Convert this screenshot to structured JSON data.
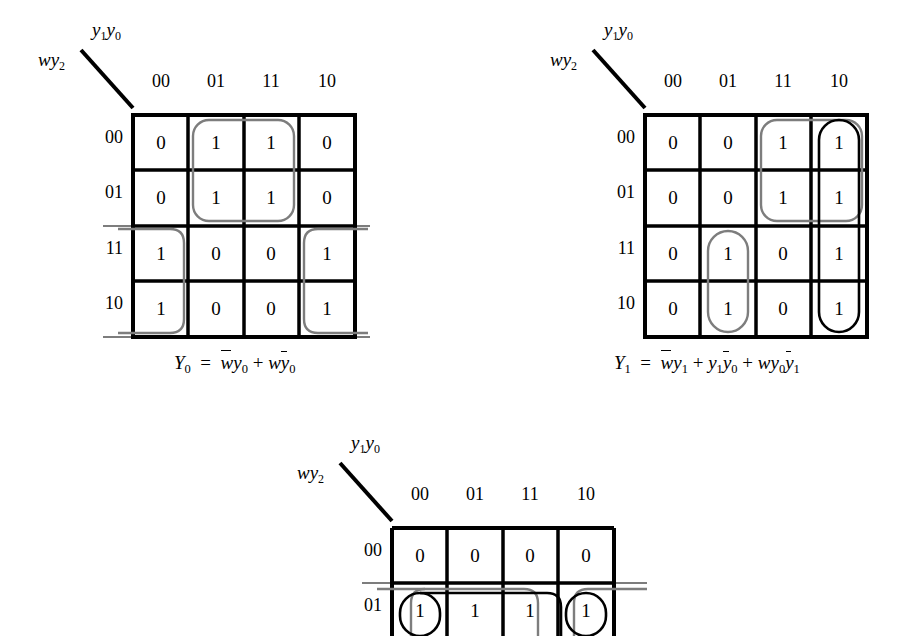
{
  "page": {
    "background": "#ffffff",
    "grid_color": "#000000",
    "group_black": "#000000",
    "group_gray": "#7d7d7d"
  },
  "maps": [
    {
      "id": "kmap-y0",
      "row_var_label": "wy2",
      "col_var_label": "y1y0",
      "col_headers": [
        "00",
        "01",
        "11",
        "10"
      ],
      "row_headers": [
        "00",
        "01",
        "11",
        "10"
      ],
      "cells": [
        [
          "0",
          "1",
          "1",
          "0"
        ],
        [
          "0",
          "1",
          "1",
          "0"
        ],
        [
          "1",
          "0",
          "0",
          "1"
        ],
        [
          "1",
          "0",
          "0",
          "1"
        ]
      ],
      "groups": [
        {
          "name": "group-w-bar-y0",
          "color": "gray",
          "cols": [
            1,
            2
          ],
          "rows": [
            0,
            1
          ],
          "wrap": "none"
        },
        {
          "name": "group-w-y0-bar",
          "color": "gray",
          "cols": [
            0,
            3
          ],
          "rows": [
            2,
            3
          ],
          "wrap": "horizontal"
        }
      ],
      "formula": {
        "lhs": "Y",
        "lhs_sub": "0",
        "eq": "=",
        "terms": [
          {
            "vars": [
              {
                "sym": "w",
                "bar": true,
                "sub": ""
              },
              {
                "sym": "y",
                "bar": false,
                "sub": "0"
              }
            ]
          },
          {
            "vars": [
              {
                "sym": "w",
                "bar": false,
                "sub": ""
              },
              {
                "sym": "y",
                "bar": true,
                "sub": "0"
              }
            ]
          }
        ],
        "plain": "Y0 = w̄y0 + wȳ0"
      }
    },
    {
      "id": "kmap-y1",
      "row_var_label": "wy2",
      "col_var_label": "y1y0",
      "col_headers": [
        "00",
        "01",
        "11",
        "10"
      ],
      "row_headers": [
        "00",
        "01",
        "11",
        "10"
      ],
      "cells": [
        [
          "0",
          "0",
          "1",
          "1"
        ],
        [
          "0",
          "0",
          "1",
          "1"
        ],
        [
          "0",
          "1",
          "0",
          "1"
        ],
        [
          "0",
          "1",
          "0",
          "1"
        ]
      ],
      "groups": [
        {
          "name": "group-w-bar-y1",
          "color": "gray",
          "cols": [
            2,
            3
          ],
          "rows": [
            0,
            1
          ],
          "wrap": "none"
        },
        {
          "name": "group-y1-y0-bar",
          "color": "black",
          "cols": [
            3,
            3
          ],
          "rows": [
            0,
            3
          ],
          "wrap": "none"
        },
        {
          "name": "group-w-y0-y1-bar",
          "color": "gray",
          "cols": [
            1,
            1
          ],
          "rows": [
            2,
            3
          ],
          "wrap": "none"
        }
      ],
      "formula": {
        "lhs": "Y",
        "lhs_sub": "1",
        "eq": "=",
        "terms": [
          {
            "vars": [
              {
                "sym": "w",
                "bar": true,
                "sub": ""
              },
              {
                "sym": "y",
                "bar": false,
                "sub": "1"
              }
            ]
          },
          {
            "vars": [
              {
                "sym": "y",
                "bar": false,
                "sub": "1"
              },
              {
                "sym": "y",
                "bar": true,
                "sub": "0"
              }
            ]
          },
          {
            "vars": [
              {
                "sym": "w",
                "bar": false,
                "sub": ""
              },
              {
                "sym": "y",
                "bar": false,
                "sub": "0"
              },
              {
                "sym": "y",
                "bar": true,
                "sub": "1"
              }
            ]
          }
        ],
        "plain": "Y1 = w̄y1 + y1ȳ0 + wy0ȳ1"
      }
    },
    {
      "id": "kmap-y2",
      "row_var_label": "wy2",
      "col_var_label": "y1y0",
      "col_headers": [
        "00",
        "01",
        "11",
        "10"
      ],
      "row_headers": [
        "00",
        "01"
      ],
      "cells": [
        [
          "0",
          "0",
          "0",
          "0"
        ],
        [
          "1",
          "1",
          "1",
          "1"
        ]
      ],
      "groups": [
        {
          "name": "group-row01-full",
          "color": "gray",
          "cols": [
            0,
            3
          ],
          "rows": [
            1,
            1
          ],
          "wrap": "horizontal"
        },
        {
          "name": "group-row01-inner",
          "color": "black",
          "cols": [
            0,
            3
          ],
          "rows": [
            1,
            1
          ],
          "wrap": "horizontal"
        }
      ],
      "formula": null
    }
  ]
}
